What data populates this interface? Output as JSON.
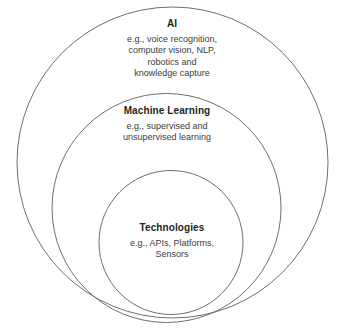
{
  "diagram": {
    "type": "nested-circles",
    "background_color": "#ffffff",
    "stroke_color": "#6f6f6f",
    "title_color": "#231f20",
    "description_color": "#3c3c3c",
    "layers": [
      {
        "id": "ai",
        "title": "AI",
        "description": "e.g., voice recognition, computer vision, NLP, robotics and knowledge capture",
        "description_lines": [
          "e.g., voice recognition,",
          "computer vision, NLP,",
          "robotics and",
          "knowledge capture"
        ],
        "circle": {
          "cx": 172.5,
          "cy": 162.5,
          "r": 155.5
        }
      },
      {
        "id": "machine-learning",
        "title": "Machine Learning",
        "description": "e.g., supervised and unsupervised learning",
        "description_lines": [
          "e.g., supervised and",
          "unsupervised learning"
        ],
        "circle": {
          "cx": 166.5,
          "cy": 208.0,
          "r": 114.5
        }
      },
      {
        "id": "technologies",
        "title": "Technologies",
        "description": "e.g., APIs, Platforms, Sensors",
        "description_lines": [
          "e.g., APIs, Platforms,",
          "Sensors"
        ],
        "circle": {
          "cx": 171.0,
          "cy": 242.5,
          "r": 72.0
        }
      }
    ]
  }
}
